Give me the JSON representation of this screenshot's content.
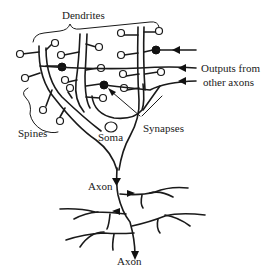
{
  "diagram": {
    "type": "neuron-schematic",
    "labels": {
      "dendrites": "Dendrites",
      "outputs_line1": "Outputs from",
      "outputs_line2": "other axons",
      "synapses": "Synapses",
      "spines": "Spines",
      "soma": "Soma",
      "axon_upper": "Axon",
      "axon_lower": "Axon"
    },
    "colors": {
      "stroke": "#1a1a1a",
      "background": "#ffffff",
      "synapse_fill": "#111111"
    }
  }
}
